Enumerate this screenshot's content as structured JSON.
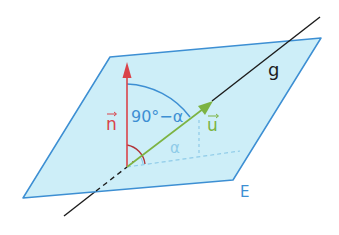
{
  "diagram": {
    "colors": {
      "plane_fill": "#cdeef8",
      "plane_edge": "#3d8fd3",
      "normal": "#d9434a",
      "direction": "#7cb342",
      "line": "#1c1c1c",
      "angle_blue": "#3d8fd3",
      "angle_light": "#8fcbe8",
      "angle_red": "#b0343a"
    },
    "labels": {
      "normal_vector": "n",
      "direction_vector": "u",
      "line": "g",
      "plane": "E",
      "complement_angle": "90°−α",
      "angle": "α"
    }
  }
}
